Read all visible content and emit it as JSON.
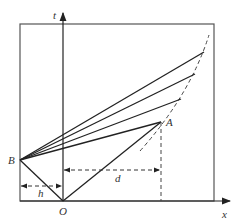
{
  "diagram": {
    "axes": {
      "t_label": "t",
      "x_label": "x"
    },
    "points": {
      "B": "B",
      "O": "O",
      "A": "A"
    },
    "dimensions": {
      "h": "h",
      "d": "d"
    },
    "colors": {
      "line": "#222222",
      "dashed": "#444444",
      "frame": "#555555"
    }
  }
}
